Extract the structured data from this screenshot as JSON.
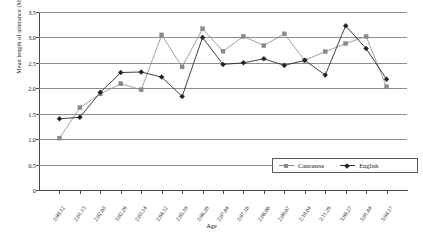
{
  "chart_data": {
    "type": "line",
    "title": "",
    "xlabel": "Age",
    "ylabel": "Mean length of utterance (MLU(w))",
    "ylim": [
      0,
      3.5
    ],
    "ytick_labels": [
      "0",
      "0.5",
      "1.0",
      "1.5",
      "2.0",
      "2.5",
      "3.0",
      "3.5"
    ],
    "ytick_values": [
      0,
      0.5,
      1.0,
      1.5,
      2.0,
      2.5,
      3.0,
      3.5
    ],
    "grid": "horizontal",
    "legend_position": "inside-lower-right",
    "categories": [
      "2;00,12",
      "2;01,13",
      "2;02,03",
      "3;02,29",
      "2;03,14",
      "2;04,12",
      "2;05,10",
      "2;06,20",
      "2;07,04",
      "2;07,18",
      "2;08,08",
      "2;09,07",
      "2;10,04",
      "2;11,29",
      "3;00,27",
      "3;01,04",
      "3;04,17"
    ],
    "series": [
      {
        "name": "Cantonese",
        "color": "#8a8a8a",
        "marker": "square",
        "values": [
          1.02,
          1.62,
          1.89,
          2.09,
          1.97,
          3.05,
          2.42,
          3.17,
          2.73,
          3.02,
          2.84,
          3.07,
          2.55,
          2.72,
          2.88,
          3.02,
          2.03
        ]
      },
      {
        "name": "English",
        "color": "#222222",
        "marker": "diamond",
        "values": [
          1.4,
          1.43,
          1.92,
          2.31,
          2.32,
          2.22,
          1.84,
          3.0,
          2.47,
          2.5,
          2.58,
          2.45,
          2.55,
          2.26,
          3.23,
          2.78,
          2.18
        ]
      }
    ]
  },
  "legend": {
    "entries": [
      {
        "label": "Cantonese"
      },
      {
        "label": "English"
      }
    ]
  }
}
